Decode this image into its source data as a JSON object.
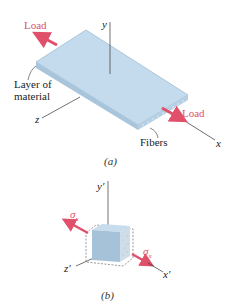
{
  "figure_a": {
    "caption": "(a)",
    "axis_x": "x",
    "axis_y": "y",
    "axis_z": "z",
    "load_left": "Load",
    "load_right": "Load",
    "layer_label_line1": "Layer of",
    "layer_label_line2": "material",
    "fibers_label": "Fibers"
  },
  "figure_b": {
    "caption": "(b)",
    "axis_x": "x′",
    "axis_y": "y′",
    "axis_z": "z′",
    "stress_left": "σ",
    "stress_left_sub": "x",
    "stress_right": "σ",
    "stress_right_sub": "x"
  },
  "colors": {
    "load_red": "#e0506a",
    "plate_blue": "#b9d3e6",
    "plate_edge": "#8fb1cc"
  }
}
